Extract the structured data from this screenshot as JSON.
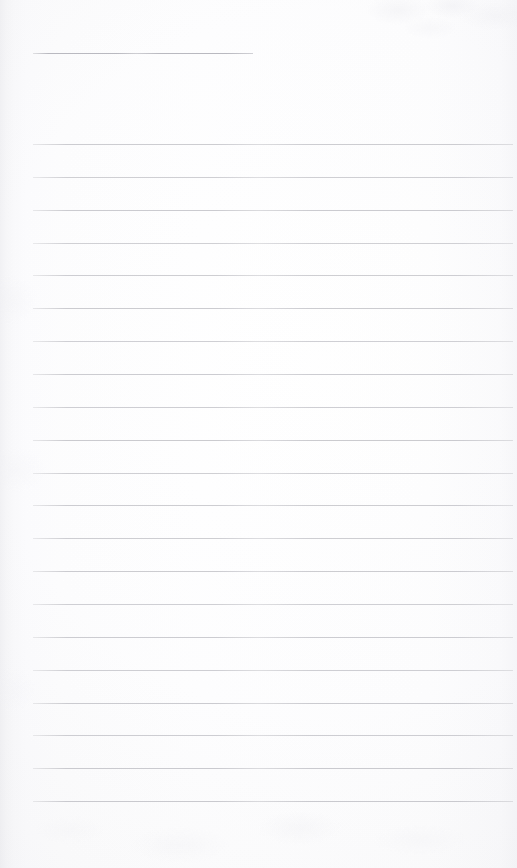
{
  "document": {
    "kind": "scanned-page",
    "subject": "blank ruled notepad page",
    "text_content": "",
    "handwriting_present": false,
    "printed_text_present": false
  },
  "page": {
    "width": 517,
    "height": 868,
    "background_color": "#fdfdfd",
    "paper_edge_shadow_color": "#f3f3f5"
  },
  "rules": {
    "line_color": "#c9c9ce",
    "header_line_color": "#b9b9c0",
    "line_thickness": 1,
    "left_margin": 33,
    "right_edge": 513,
    "body_line_spacing": 32.85,
    "body_line_count": 21,
    "first_body_line_y": 144,
    "last_body_line_y": 801,
    "bottom_margin": 67,
    "header_line": {
      "y": 53,
      "x_start": 33,
      "x_end": 253,
      "length": 220
    },
    "body_lines": [
      {
        "index": 1,
        "y": 144,
        "x_start": 33,
        "x_end": 513,
        "opacity": 0.92
      },
      {
        "index": 2,
        "y": 176.9,
        "x_start": 33,
        "x_end": 513,
        "opacity": 0.88
      },
      {
        "index": 3,
        "y": 209.7,
        "x_start": 33,
        "x_end": 513,
        "opacity": 0.95
      },
      {
        "index": 4,
        "y": 242.6,
        "x_start": 33,
        "x_end": 513,
        "opacity": 0.86
      },
      {
        "index": 5,
        "y": 275.4,
        "x_start": 33,
        "x_end": 513,
        "opacity": 0.9
      },
      {
        "index": 6,
        "y": 308.3,
        "x_start": 33,
        "x_end": 513,
        "opacity": 0.94
      },
      {
        "index": 7,
        "y": 341.1,
        "x_start": 33,
        "x_end": 513,
        "opacity": 0.87
      },
      {
        "index": 8,
        "y": 374.0,
        "x_start": 33,
        "x_end": 513,
        "opacity": 0.93
      },
      {
        "index": 9,
        "y": 406.8,
        "x_start": 33,
        "x_end": 513,
        "opacity": 0.89
      },
      {
        "index": 10,
        "y": 439.7,
        "x_start": 33,
        "x_end": 513,
        "opacity": 0.96
      },
      {
        "index": 11,
        "y": 472.5,
        "x_start": 33,
        "x_end": 513,
        "opacity": 0.88
      },
      {
        "index": 12,
        "y": 505.4,
        "x_start": 33,
        "x_end": 513,
        "opacity": 0.92
      },
      {
        "index": 13,
        "y": 538.2,
        "x_start": 33,
        "x_end": 513,
        "opacity": 0.9
      },
      {
        "index": 14,
        "y": 571.1,
        "x_start": 33,
        "x_end": 513,
        "opacity": 0.94
      },
      {
        "index": 15,
        "y": 603.9,
        "x_start": 33,
        "x_end": 513,
        "opacity": 0.87
      },
      {
        "index": 16,
        "y": 636.8,
        "x_start": 33,
        "x_end": 513,
        "opacity": 0.93
      },
      {
        "index": 17,
        "y": 669.6,
        "x_start": 33,
        "x_end": 513,
        "opacity": 0.89
      },
      {
        "index": 18,
        "y": 702.5,
        "x_start": 33,
        "x_end": 513,
        "opacity": 0.95
      },
      {
        "index": 19,
        "y": 735.3,
        "x_start": 33,
        "x_end": 513,
        "opacity": 0.91
      },
      {
        "index": 20,
        "y": 768.2,
        "x_start": 33,
        "x_end": 513,
        "opacity": 0.97
      },
      {
        "index": 21,
        "y": 801.0,
        "x_start": 33,
        "x_end": 513,
        "opacity": 0.98
      }
    ]
  }
}
